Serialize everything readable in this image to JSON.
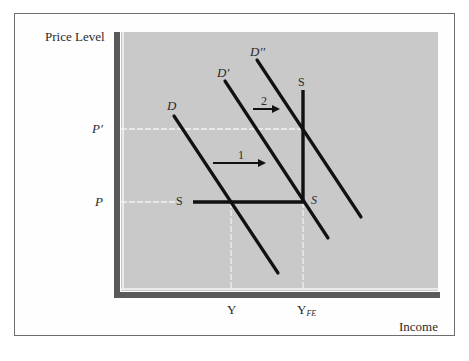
{
  "figure": {
    "y_axis_label": "Price Level",
    "x_axis_label": "Income",
    "y_ticks": [
      {
        "label": "P'",
        "y": 129
      },
      {
        "label": "P",
        "y": 202
      }
    ],
    "x_ticks": [
      {
        "label": "Y",
        "x": 231
      },
      {
        "label": "Y",
        "sub": "FE",
        "x": 303
      }
    ],
    "curves": {
      "D": {
        "label": "D",
        "from": [
          174,
          116
        ],
        "to": [
          278,
          273
        ]
      },
      "D_prime": {
        "label": "D'",
        "from": [
          225,
          81
        ],
        "to": [
          328,
          238
        ]
      },
      "D_double_prime": {
        "label": "D''",
        "from": [
          257,
          60
        ],
        "to": [
          361,
          217
        ]
      },
      "S": {
        "label_left": "S",
        "label_corner": "S",
        "label_top": "S",
        "horizontal": {
          "from": [
            193,
            202
          ],
          "to": [
            303,
            202
          ]
        },
        "vertical": {
          "from": [
            303,
            90
          ],
          "to": [
            303,
            202
          ]
        }
      }
    },
    "arrows": [
      {
        "label": "1",
        "from": [
          213,
          163
        ],
        "to": [
          265,
          163
        ]
      },
      {
        "label": "2",
        "from": [
          253,
          109
        ],
        "to": [
          279,
          109
        ]
      }
    ],
    "colors": {
      "plot_background": "#c9c9c9",
      "axis_bar": "#5a5a5a",
      "curve": "#111111",
      "guide": "#f2f2f2",
      "frame": "#6e6e6e",
      "text": "#2a2a2a"
    }
  }
}
